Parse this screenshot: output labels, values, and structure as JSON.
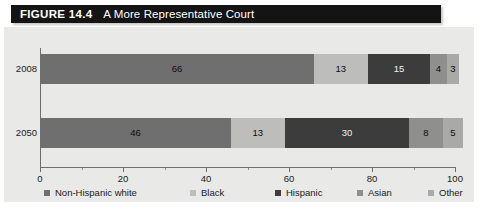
{
  "figure": {
    "number_label": "FIGURE 14.4",
    "title": "A More Representative Court"
  },
  "chart_data": {
    "type": "bar",
    "orientation": "horizontal",
    "stacked": true,
    "stacked_mode": "percent",
    "title": "A More Representative Court",
    "xlabel": "",
    "ylabel": "",
    "xlim": [
      0,
      100
    ],
    "xticks": [
      0,
      20,
      40,
      60,
      80,
      100
    ],
    "xtick_labels": [
      "0",
      "20",
      "40",
      "60",
      "80",
      "100"
    ],
    "grid": false,
    "legend_position": "bottom",
    "categories": [
      "2008",
      "2050"
    ],
    "series": [
      {
        "name": "Non-Hispanic white",
        "color": "#6f6f6f",
        "text_on_dark": false,
        "values": [
          66,
          46
        ]
      },
      {
        "name": "Black",
        "color": "#bdbdbb",
        "text_on_dark": false,
        "values": [
          13,
          13
        ]
      },
      {
        "name": "Hispanic",
        "color": "#3c3c3c",
        "text_on_dark": true,
        "values": [
          15,
          30
        ]
      },
      {
        "name": "Asian",
        "color": "#8f8f8e",
        "text_on_dark": false,
        "values": [
          4,
          8
        ]
      },
      {
        "name": "Other",
        "color": "#a9a9a7",
        "text_on_dark": false,
        "values": [
          3,
          5
        ]
      }
    ]
  },
  "colors": {
    "title_bar_background": "#141414",
    "title_bar_text": "#ffffff",
    "panel_background": "#e9e9e7",
    "axis": "#6d6d6d",
    "text": "#1a1a1a"
  }
}
